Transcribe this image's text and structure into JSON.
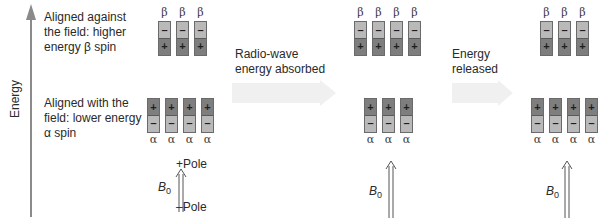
{
  "axis": {
    "label": "Energy",
    "color": "#8a8a8a"
  },
  "descriptions": {
    "beta": [
      "Aligned against",
      "the field: higher",
      "energy β spin"
    ],
    "alpha": [
      "Aligned with the",
      "field: lower energy",
      "α spin"
    ]
  },
  "transitions": [
    {
      "label_lines": [
        "Radio-wave",
        "energy absorbed"
      ]
    },
    {
      "label_lines": [
        "Energy",
        "released"
      ]
    }
  ],
  "symbols": {
    "beta": "β",
    "alpha": "α",
    "plus": "+",
    "minus": "–",
    "field_label": "B",
    "field_sub": "0"
  },
  "poles": {
    "positive": "+Pole",
    "negative": "–Pole"
  },
  "panels": [
    {
      "name": "initial",
      "beta_count": 3,
      "alpha_count": 4
    },
    {
      "name": "after-absorption",
      "beta_count": 4,
      "alpha_count": 3
    },
    {
      "name": "after-release",
      "beta_count": 3,
      "alpha_count": 4
    }
  ],
  "colors": {
    "magnet_light": "#b9b9b9",
    "magnet_dark": "#7e7e7e",
    "transition_arrow": "#f0f0f0"
  }
}
